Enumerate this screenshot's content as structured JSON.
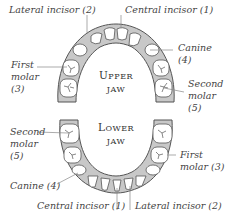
{
  "diagram": {
    "upper_jaw": {
      "title_first": "U",
      "title_rest": "PPER",
      "title_line2": "JAW",
      "labels": {
        "lateral_incisor": "Lateral incisor (2)",
        "central_incisor": "Central incisor (1)",
        "canine_line1": "Canine",
        "canine_line2": "(4)",
        "first_molar_line1": "First",
        "first_molar_line2": "molar",
        "first_molar_line3": "(3)",
        "second_molar_line1": "Second",
        "second_molar_line2": "molar",
        "second_molar_line3": "(5)"
      }
    },
    "lower_jaw": {
      "title_first": "L",
      "title_rest": "OWER",
      "title_line2": "JAW",
      "labels": {
        "second_molar_line1": "Second",
        "second_molar_line2": "molar",
        "second_molar_line3": "(5)",
        "first_molar_line1": "First",
        "first_molar_line2": "molar (3)",
        "canine": "Canine (4)",
        "central_incisor": "Central incisor (1)",
        "lateral_incisor": "Lateral incisor (2)"
      }
    },
    "colors": {
      "gum": "#c8c8c8",
      "tooth": "#ffffff",
      "outline": "#555555",
      "leader": "#888888"
    }
  }
}
